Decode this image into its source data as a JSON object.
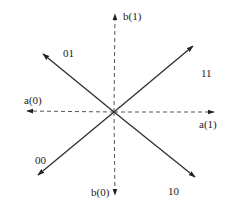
{
  "diagram": {
    "center": {
      "x": 114,
      "y": 112
    },
    "axes": [
      {
        "id": "b1",
        "label": "b(1)",
        "style": "dashed",
        "x2": 115,
        "y2": 14,
        "label_x": 123,
        "label_y": 20
      },
      {
        "id": "b0",
        "label": "b(0)",
        "style": "dashed",
        "x2": 115,
        "y2": 195,
        "label_x": 91,
        "label_y": 196
      },
      {
        "id": "a0",
        "label": "a(0)",
        "style": "dashed",
        "x2": 27,
        "y2": 111,
        "label_x": 24,
        "label_y": 104
      },
      {
        "id": "a1",
        "label": "a(1)",
        "style": "dashed",
        "x2": 214,
        "y2": 112,
        "label_x": 199,
        "label_y": 128
      }
    ],
    "vectors": [
      {
        "id": "v01",
        "label": "01",
        "x2": 43,
        "y2": 54,
        "label_x": 63,
        "label_y": 57
      },
      {
        "id": "v11",
        "label": "11",
        "x2": 193,
        "y2": 46,
        "label_x": 201,
        "label_y": 77
      },
      {
        "id": "v00",
        "label": "00",
        "x2": 38,
        "y2": 175,
        "label_x": 35,
        "label_y": 164
      },
      {
        "id": "v10",
        "label": "10",
        "x2": 195,
        "y2": 177,
        "label_x": 168,
        "label_y": 195
      }
    ],
    "colors": {
      "line": "#333333",
      "dashed": "#555555",
      "background": "#ffffff"
    }
  }
}
